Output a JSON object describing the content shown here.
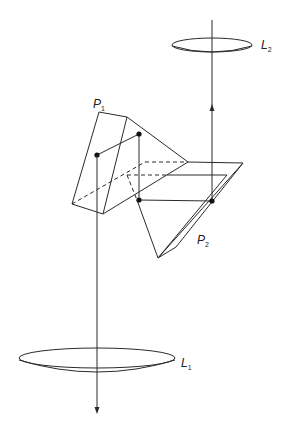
{
  "diagram": {
    "labels": {
      "p1": {
        "main": "P",
        "sub": "1"
      },
      "p2": {
        "main": "P",
        "sub": "2"
      },
      "l1": {
        "main": "L",
        "sub": "1"
      },
      "l2": {
        "main": "L",
        "sub": "2"
      }
    },
    "colors": {
      "line": "#2a2a2a",
      "background": "#ffffff"
    }
  }
}
